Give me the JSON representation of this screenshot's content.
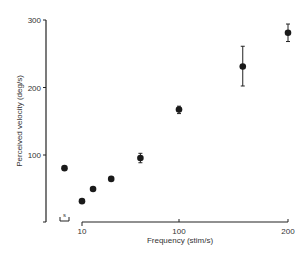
{
  "chart_data": {
    "type": "scatter",
    "title": "",
    "xlabel": "Frequency (stim/s)",
    "ylabel": "Perceived velocity (deg/s)",
    "x_scale": "log",
    "x_ticks": [
      10,
      100,
      200
    ],
    "y_ticks": [
      100,
      200,
      300
    ],
    "ylim": [
      0,
      300
    ],
    "xlim": [
      10,
      200
    ],
    "grid": false,
    "legend": null,
    "annotations": [
      {
        "label": "s",
        "description": "stationary condition marker (bracket below the point left of x-axis origin)"
      }
    ],
    "series": [
      {
        "name": "Perceived velocity",
        "marker": "filled-circle",
        "color": "#1a1a1a",
        "points": [
          {
            "x": "s",
            "y": 80
          },
          {
            "x": 10,
            "y": 31
          },
          {
            "x": 13,
            "y": 49
          },
          {
            "x": 20,
            "y": 64
          },
          {
            "x": 40,
            "y": 95,
            "err_low": 88,
            "err_high": 102
          },
          {
            "x": 100,
            "y": 167,
            "err_low": 161,
            "err_high": 172
          },
          {
            "x": 150,
            "y": 231,
            "err_low": 202,
            "err_high": 261
          },
          {
            "x": 200,
            "y": 281,
            "err_low": 268,
            "err_high": 294
          }
        ]
      }
    ]
  },
  "labels": {
    "xlabel": "Frequency (stim/s)",
    "ylabel": "Perceived velocity (deg/s)",
    "stationary": "s",
    "yticks": [
      "100",
      "200",
      "300"
    ],
    "xticks": [
      "10",
      "100",
      "200"
    ]
  }
}
